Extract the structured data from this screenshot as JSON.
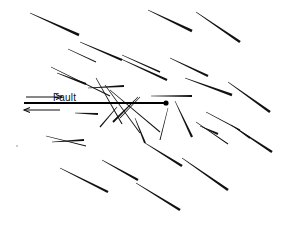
{
  "figure": {
    "width": 282,
    "height": 225,
    "background_color": "#ffffff",
    "ink_color": "#111111"
  },
  "fault": {
    "label": "Fault",
    "label_x": 53,
    "label_y": 93,
    "line": {
      "x1": 24,
      "y1": 103,
      "x2": 166,
      "y2": 103
    },
    "endpoint_marker": {
      "cx": 166,
      "cy": 103,
      "r": 2.6,
      "kind": "filled-dot"
    },
    "sense_of_shear": "dextral-top-right",
    "arrows": [
      {
        "name": "upper-shear-arrow",
        "x1": 26,
        "y1": 97,
        "x2": 62,
        "y2": 97,
        "direction": "right"
      },
      {
        "name": "lower-shear-arrow",
        "x1": 60,
        "y1": 110,
        "x2": 24,
        "y2": 110,
        "direction": "left"
      }
    ]
  },
  "chart_data": {
    "type": "scatter",
    "xlabel": "",
    "ylabel": "",
    "xlim": [
      0,
      282
    ],
    "ylim": [
      0,
      225
    ],
    "grid": false,
    "legend": null,
    "annotations": [
      {
        "text": "Fault",
        "x": 53,
        "y": 93
      }
    ],
    "fractures": [
      {
        "x1": 30,
        "y1": 13,
        "x2": 79,
        "y2": 35,
        "w": 2.6,
        "taper": 0.2
      },
      {
        "x1": 80,
        "y1": 42,
        "x2": 122,
        "y2": 60,
        "w": 2.4,
        "taper": 0.22
      },
      {
        "x1": 122,
        "y1": 55,
        "x2": 160,
        "y2": 72,
        "w": 1.4,
        "taper": 0.3
      },
      {
        "x1": 121,
        "y1": 59,
        "x2": 167,
        "y2": 80,
        "w": 2.4,
        "taper": 0.2
      },
      {
        "x1": 148,
        "y1": 10,
        "x2": 192,
        "y2": 31,
        "w": 2.6,
        "taper": 0.18
      },
      {
        "x1": 196,
        "y1": 12,
        "x2": 240,
        "y2": 42,
        "w": 2.6,
        "taper": 0.18
      },
      {
        "x1": 170,
        "y1": 58,
        "x2": 208,
        "y2": 76,
        "w": 2.2,
        "taper": 0.22
      },
      {
        "x1": 185,
        "y1": 78,
        "x2": 232,
        "y2": 95,
        "w": 2.4,
        "taper": 0.2
      },
      {
        "x1": 228,
        "y1": 82,
        "x2": 270,
        "y2": 112,
        "w": 2.6,
        "taper": 0.18
      },
      {
        "x1": 51,
        "y1": 67,
        "x2": 110,
        "y2": 96,
        "w": 1.2,
        "taper": 0.45
      },
      {
        "x1": 57,
        "y1": 73,
        "x2": 86,
        "y2": 84,
        "w": 2.4,
        "taper": 0.24
      },
      {
        "x1": 88,
        "y1": 88,
        "x2": 124,
        "y2": 86,
        "w": 2.2,
        "taper": 0.2
      },
      {
        "x1": 151,
        "y1": 96,
        "x2": 192,
        "y2": 96,
        "w": 2.2,
        "taper": 0.2
      },
      {
        "x1": 96,
        "y1": 78,
        "x2": 122,
        "y2": 124,
        "w": 1.1,
        "taper": 0.5
      },
      {
        "x1": 105,
        "y1": 85,
        "x2": 140,
        "y2": 133,
        "w": 1.0,
        "taper": 0.55
      },
      {
        "x1": 110,
        "y1": 90,
        "x2": 160,
        "y2": 132,
        "w": 1.0,
        "taper": 0.55
      },
      {
        "x1": 117,
        "y1": 107,
        "x2": 100,
        "y2": 127,
        "w": 1.2,
        "taper": 0.45
      },
      {
        "x1": 75,
        "y1": 113,
        "x2": 98,
        "y2": 114,
        "w": 2.0,
        "taper": 0.25
      },
      {
        "x1": 138,
        "y1": 97,
        "x2": 113,
        "y2": 122,
        "w": 2.0,
        "taper": 0.25
      },
      {
        "x1": 140,
        "y1": 97,
        "x2": 120,
        "y2": 118,
        "w": 1.0,
        "taper": 0.5
      },
      {
        "x1": 135,
        "y1": 118,
        "x2": 145,
        "y2": 143,
        "w": 2.0,
        "taper": 0.28
      },
      {
        "x1": 145,
        "y1": 143,
        "x2": 182,
        "y2": 166,
        "w": 2.6,
        "taper": 0.18
      },
      {
        "x1": 175,
        "y1": 101,
        "x2": 192,
        "y2": 137,
        "w": 2.2,
        "taper": 0.24
      },
      {
        "x1": 168,
        "y1": 108,
        "x2": 160,
        "y2": 140,
        "w": 1.0,
        "taper": 0.5
      },
      {
        "x1": 196,
        "y1": 122,
        "x2": 228,
        "y2": 144,
        "w": 1.0,
        "taper": 0.5
      },
      {
        "x1": 200,
        "y1": 126,
        "x2": 218,
        "y2": 134,
        "w": 2.0,
        "taper": 0.25
      },
      {
        "x1": 231,
        "y1": 125,
        "x2": 272,
        "y2": 152,
        "w": 2.4,
        "taper": 0.2
      },
      {
        "x1": 46,
        "y1": 136,
        "x2": 86,
        "y2": 146,
        "w": 1.0,
        "taper": 0.5
      },
      {
        "x1": 52,
        "y1": 142,
        "x2": 84,
        "y2": 140,
        "w": 2.2,
        "taper": 0.22
      },
      {
        "x1": 60,
        "y1": 168,
        "x2": 108,
        "y2": 192,
        "w": 2.4,
        "taper": 0.2
      },
      {
        "x1": 102,
        "y1": 160,
        "x2": 138,
        "y2": 180,
        "w": 2.4,
        "taper": 0.2
      },
      {
        "x1": 136,
        "y1": 183,
        "x2": 180,
        "y2": 210,
        "w": 2.6,
        "taper": 0.18
      },
      {
        "x1": 182,
        "y1": 158,
        "x2": 228,
        "y2": 190,
        "w": 2.6,
        "taper": 0.18
      },
      {
        "x1": 206,
        "y1": 112,
        "x2": 240,
        "y2": 130,
        "w": 1.0,
        "taper": 0.5
      },
      {
        "x1": 236,
        "y1": 128,
        "x2": 250,
        "y2": 138,
        "w": 2.0,
        "taper": 0.25
      },
      {
        "x1": 68,
        "y1": 49,
        "x2": 96,
        "y2": 62,
        "w": 1.0,
        "taper": 0.5
      }
    ]
  }
}
